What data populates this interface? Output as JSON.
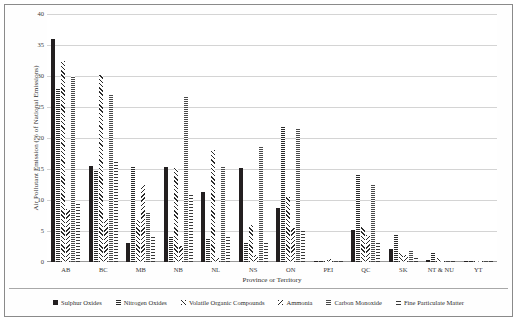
{
  "chart_data": {
    "type": "bar",
    "title": "",
    "xlabel": "Province or Territory",
    "ylabel": "Air Pollutant Emission (% of National Emissions)",
    "ylim": [
      0,
      40
    ],
    "yticks": [
      0,
      5,
      10,
      15,
      20,
      25,
      30,
      35,
      40
    ],
    "ytick_labels": [
      "0",
      "5",
      "10",
      "15",
      "20",
      "25",
      "30",
      "35",
      "40"
    ],
    "grid": true,
    "legend_position": "bottom",
    "categories": [
      "AB",
      "BC",
      "MB",
      "NB",
      "NL",
      "NS",
      "ON",
      "PEI",
      "QC",
      "SK",
      "NT & NU",
      "YT"
    ],
    "series": [
      {
        "name": "Sulphur Oxides",
        "key": "s-sox",
        "values": [
          36.0,
          15.5,
          3.0,
          15.4,
          11.3,
          15.1,
          8.7,
          0.2,
          5.1,
          2.1,
          0.3,
          0.05
        ]
      },
      {
        "name": "Nitrogen Oxides",
        "key": "s-nox",
        "values": [
          28.0,
          14.6,
          15.3,
          4.0,
          3.9,
          3.2,
          22.0,
          0.3,
          14.0,
          4.5,
          1.4,
          0.2
        ]
      },
      {
        "name": "Volatile Organic Compounds",
        "key": "s-voc",
        "values": [
          32.4,
          30.2,
          6.7,
          15.2,
          18.1,
          6.0,
          10.5,
          0.3,
          5.7,
          1.5,
          0.6,
          0.1
        ]
      },
      {
        "name": "Ammonia",
        "key": "s-nh3",
        "values": [
          8.5,
          7.0,
          12.4,
          2.6,
          0.6,
          1.1,
          5.5,
          0.5,
          4.3,
          1.1,
          0.1,
          0.05
        ]
      },
      {
        "name": "Carbon Monoxide",
        "key": "s-co",
        "values": [
          30.0,
          27.1,
          8.0,
          26.8,
          15.3,
          18.7,
          21.4,
          0.4,
          12.4,
          1.8,
          0.4,
          0.1
        ]
      },
      {
        "name": "Fine Particulate Matter",
        "key": "s-pm",
        "values": [
          9.4,
          16.2,
          4.3,
          10.8,
          4.2,
          3.4,
          5.4,
          0.3,
          3.1,
          1.0,
          0.2,
          0.05
        ]
      }
    ]
  },
  "axis": {
    "y_title": "Air Pollutant Emission (% of National Emissions)",
    "x_title": "Province or Territory"
  },
  "legend": {
    "items": [
      {
        "label": "Sulphur Oxides",
        "key": "s-sox"
      },
      {
        "label": "Nitrogen Oxides",
        "key": "s-nox"
      },
      {
        "label": "Volatile Organic Compounds",
        "key": "s-voc"
      },
      {
        "label": "Ammonia",
        "key": "s-nh3"
      },
      {
        "label": "Carbon Monoxide",
        "key": "s-co"
      },
      {
        "label": "Fine Particulate Matter",
        "key": "s-pm"
      }
    ]
  }
}
